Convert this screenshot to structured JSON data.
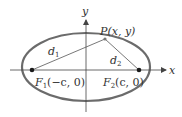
{
  "diagram": {
    "colors": {
      "ellipse": "#6b6b6b",
      "axes": "#444444",
      "lines": "#555555",
      "points": "#1a1a1a",
      "text": "#333333"
    },
    "axes": {
      "x_label": "x",
      "y_label": "y"
    },
    "point_p": {
      "label": "P(x, y)"
    },
    "focus_1": {
      "label_main": "F",
      "label_sub": "1",
      "label_coords": "(−c, 0)"
    },
    "focus_2": {
      "label_main": "F",
      "label_sub": "2",
      "label_coords": "(c, 0)"
    },
    "distance_1": {
      "label_main": "d",
      "label_sub": "1"
    },
    "distance_2": {
      "label_main": "d",
      "label_sub": "2"
    }
  }
}
